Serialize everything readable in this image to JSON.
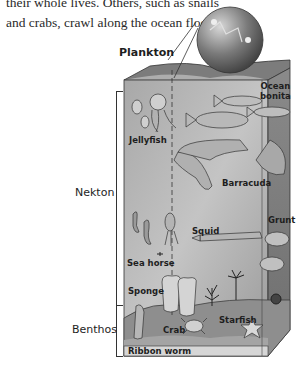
{
  "intro_text": {
    "line1": "their whole lives. Others, such as snails",
    "line2": "and crabs, crawl along the ocean floor."
  },
  "diagram": {
    "title_label": "Plankton",
    "zones": {
      "nekton": "Nekton",
      "benthos": "Benthos"
    },
    "organisms": {
      "ocean_bonita_1": "Ocean",
      "ocean_bonita_2": "bonita",
      "jellyfish": "Jellyfish",
      "barracuda": "Barracuda",
      "grunt": "Grunt",
      "squid": "Squid",
      "sea_horse": "Sea horse",
      "sponge": "Sponge",
      "crab": "Crab",
      "starfish": "Starfish",
      "ribbon_worm": "Ribbon worm"
    },
    "colors": {
      "water_front": "#9a9a9a",
      "water_side": "#7a7a7a",
      "surface_top": "#6f6f6f",
      "seafloor": "#8c8c8c",
      "globe": "#5e5e5e"
    }
  }
}
